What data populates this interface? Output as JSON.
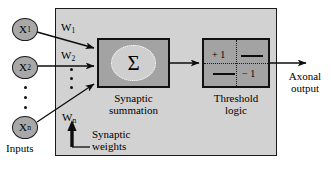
{
  "diagram": {
    "panel_color": "#d2d2d2",
    "box_color": "#a3a3a3",
    "node_color": "#a8a8a8"
  },
  "inputs": {
    "group_label": "Inputs",
    "nodes": [
      {
        "base": "X",
        "sub": "1"
      },
      {
        "base": "X",
        "sub": "2"
      },
      {
        "base": "X",
        "sub": "n"
      }
    ],
    "ellipsis": "⋮"
  },
  "weights": {
    "group_label_line1": "Synaptic",
    "group_label_line2": "weights",
    "items": [
      {
        "base": "W",
        "sub": "1"
      },
      {
        "base": "W",
        "sub": "2"
      },
      {
        "base": "W",
        "sub": "n"
      }
    ]
  },
  "summation": {
    "symbol": "Σ",
    "caption_line1": "Synaptic",
    "caption_line2": "summation"
  },
  "threshold": {
    "caption_line1": "Threshold",
    "caption_line2": "logic",
    "high_label": "+ 1",
    "low_label": "− 1"
  },
  "output": {
    "caption_line1": "Axonal",
    "caption_line2": "output"
  }
}
